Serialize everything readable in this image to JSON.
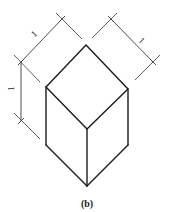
{
  "figure": {
    "caption": "(b)",
    "dimensions": {
      "left_top_edge": "1",
      "right_top_edge": "1",
      "vertical_edge": "1"
    },
    "colors": {
      "line": "#1a1a1a",
      "dimension_line": "#3a3a3a",
      "background": "#ffffff"
    }
  }
}
